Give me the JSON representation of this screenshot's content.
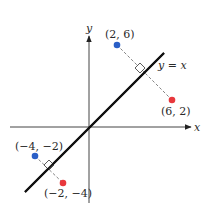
{
  "diagram": {
    "axes": {
      "x_label": "x",
      "y_label": "y",
      "origin_px": [
        89,
        127
      ],
      "color": "#333333"
    },
    "line": {
      "label": "y = x",
      "from_px": [
        25,
        192
      ],
      "to_px": [
        164,
        53
      ],
      "color": "#111111"
    },
    "point_pairs": [
      {
        "original": {
          "label": "(2, 6)",
          "px": [
            117,
            45
          ],
          "color": "#2a5fc7"
        },
        "reflected": {
          "label": "(6, 2)",
          "px": [
            172,
            100
          ],
          "color": "#e8383d"
        },
        "right_angle_px": [
          141,
          72
        ]
      },
      {
        "original": {
          "label": "(−4, −2)",
          "px": [
            35,
            156
          ],
          "color": "#2a5fc7"
        },
        "reflected": {
          "label": "(−2, −4)",
          "px": [
            63,
            183
          ],
          "color": "#e8383d"
        },
        "right_angle_px": [
          49,
          169
        ]
      }
    ],
    "colors": {
      "blue_point": "#2a5fc7",
      "red_point": "#e8383d",
      "dashed_segment": "#666666"
    }
  }
}
